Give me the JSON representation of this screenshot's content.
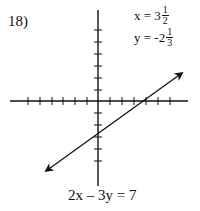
{
  "problem": {
    "number_label": "18)",
    "solution": {
      "x_prefix": "x = 3",
      "x_frac_num": "1",
      "x_frac_den": "2",
      "y_prefix": "y = -2",
      "y_frac_num": "1",
      "y_frac_den": "3"
    },
    "equation": "2x – 3y = 7"
  },
  "graph": {
    "axis_color": "#111111",
    "line_color": "#111111",
    "x_axis_ticks_left": 6,
    "x_axis_ticks_right": 6,
    "y_axis_ticks_up": 6,
    "y_axis_ticks_down": 5
  }
}
